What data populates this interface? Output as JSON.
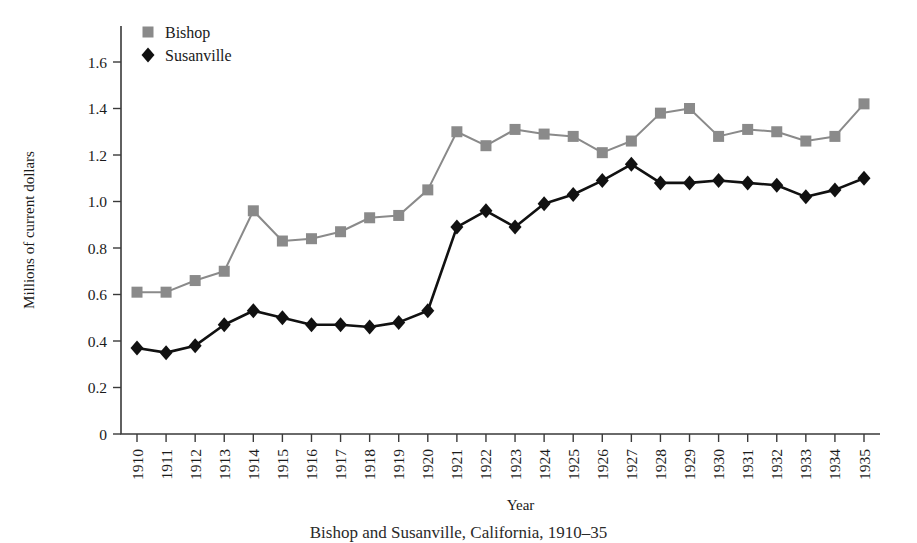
{
  "chart_data": {
    "type": "line",
    "title": "",
    "xlabel": "Year",
    "ylabel": "Millions of current dollars",
    "ylim": [
      0,
      1.7
    ],
    "ytick_values": [
      0,
      0.2,
      0.4,
      0.6,
      0.8,
      1.0,
      1.2,
      1.4,
      1.6
    ],
    "ytick_labels": [
      "0",
      "0.2",
      "0.4",
      "0.6",
      "0.8",
      "1.0",
      "1.2",
      "1.4",
      "1.6"
    ],
    "grid": false,
    "legend_position": "top-left",
    "categories": [
      1910,
      1911,
      1912,
      1913,
      1914,
      1915,
      1916,
      1917,
      1918,
      1919,
      1920,
      1921,
      1922,
      1923,
      1924,
      1925,
      1926,
      1927,
      1928,
      1929,
      1930,
      1931,
      1932,
      1933,
      1934,
      1935
    ],
    "xtick_labels": [
      "1910",
      "1911",
      "1912",
      "1913",
      "1914",
      "1915",
      "1916",
      "1917",
      "1918",
      "1919",
      "1920",
      "1921",
      "1922",
      "1923",
      "1924",
      "1925",
      "1926",
      "1927",
      "1928",
      "1929",
      "1930",
      "1931",
      "1932",
      "1933",
      "1934",
      "1935"
    ],
    "series": [
      {
        "name": "Bishop",
        "color": "#8a8a8a",
        "marker": "square",
        "values": [
          0.61,
          0.61,
          0.66,
          0.7,
          0.96,
          0.83,
          0.84,
          0.87,
          0.93,
          0.94,
          1.05,
          1.3,
          1.24,
          1.31,
          1.29,
          1.28,
          1.21,
          1.26,
          1.38,
          1.4,
          1.28,
          1.31,
          1.3,
          1.26,
          1.28,
          1.42
        ]
      },
      {
        "name": "Susanville",
        "color": "#111111",
        "marker": "diamond",
        "values": [
          0.37,
          0.35,
          0.38,
          0.47,
          0.53,
          0.5,
          0.47,
          0.47,
          0.46,
          0.48,
          0.53,
          0.89,
          0.96,
          0.89,
          0.99,
          1.03,
          1.09,
          1.16,
          1.08,
          1.08,
          1.09,
          1.08,
          1.07,
          1.02,
          1.05,
          1.1
        ]
      }
    ]
  },
  "legend": {
    "entries": [
      {
        "label": "Bishop"
      },
      {
        "label": "Susanville"
      }
    ]
  },
  "caption": {
    "text": "Bishop and Susanville, California, 1910–35"
  }
}
